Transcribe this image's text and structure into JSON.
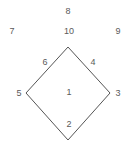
{
  "diagram": {
    "type": "labeled-diamond",
    "shape_name": "diamond",
    "colors": {
      "background": "#ffffff",
      "stroke": "#555555",
      "text": "#5a5a5a"
    },
    "vertices": [
      {
        "name": "top",
        "x": 68,
        "y": 47
      },
      {
        "name": "right",
        "x": 110,
        "y": 93
      },
      {
        "name": "bottom",
        "x": 68,
        "y": 140
      },
      {
        "name": "left",
        "x": 26,
        "y": 93
      }
    ],
    "labels": [
      {
        "id": "label-1",
        "text": "1",
        "x": 69,
        "y": 92,
        "position": "center-interior"
      },
      {
        "id": "label-2",
        "text": "2",
        "x": 69,
        "y": 124,
        "position": "interior-bottom"
      },
      {
        "id": "label-3",
        "text": "3",
        "x": 118,
        "y": 93,
        "position": "right-vertex-outside"
      },
      {
        "id": "label-4",
        "text": "4",
        "x": 93,
        "y": 62,
        "position": "interior-upper-right"
      },
      {
        "id": "label-5",
        "text": "5",
        "x": 19,
        "y": 93,
        "position": "left-vertex-outside"
      },
      {
        "id": "label-6",
        "text": "6",
        "x": 45,
        "y": 62,
        "position": "interior-upper-left"
      },
      {
        "id": "label-7",
        "text": "7",
        "x": 12,
        "y": 31,
        "position": "outside-top-left"
      },
      {
        "id": "label-8",
        "text": "8",
        "x": 68,
        "y": 11,
        "position": "outside-top-center"
      },
      {
        "id": "label-9",
        "text": "9",
        "x": 118,
        "y": 31,
        "position": "outside-top-right"
      },
      {
        "id": "label-10",
        "text": "10",
        "x": 69,
        "y": 31,
        "position": "outside-top-above-vertex"
      }
    ]
  }
}
